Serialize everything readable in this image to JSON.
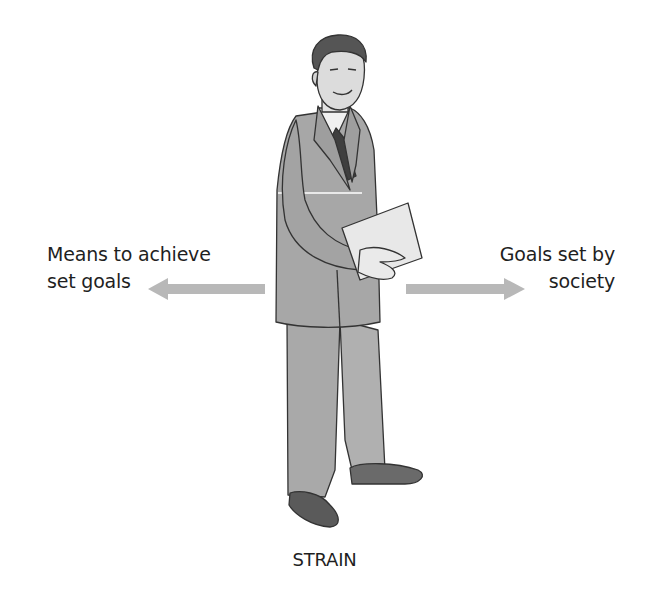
{
  "diagram": {
    "left_label": {
      "line1": "Means to achieve",
      "line2": "set goals"
    },
    "right_label": {
      "line1": "Goals set by",
      "line2": "society"
    },
    "bottom_label": "STRAIN",
    "arrows": [
      {
        "direction": "left",
        "color": "#b8b8b8"
      },
      {
        "direction": "right",
        "color": "#b8b8b8"
      }
    ],
    "figure": "businessman-holding-document"
  }
}
